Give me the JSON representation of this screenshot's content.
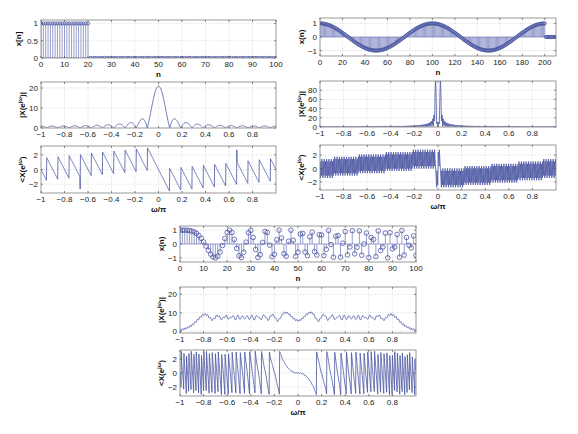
{
  "figure": {
    "width": 578,
    "height": 434,
    "line_color": "#4a55a2",
    "stem_color": "#6b74b8",
    "marker_color": "#4a55a2",
    "grid_color": "#c8c8c8",
    "axes_color": "#808080"
  },
  "chart_data": [
    {
      "id": "left-signal",
      "type": "stem",
      "box": [
        41,
        20,
        276,
        58
      ],
      "title": "",
      "xlabel": "n",
      "ylabel": "x[n]",
      "xlim": [
        0,
        100
      ],
      "ylim": [
        0,
        1.1
      ],
      "xticks": [
        0,
        10,
        20,
        30,
        40,
        50,
        60,
        70,
        80,
        90,
        100
      ],
      "yticks": [
        0,
        0.5,
        1
      ],
      "ytick_labels": [
        "0",
        "0.5",
        "1"
      ],
      "signal": {
        "kind": "rect",
        "n_start": 0,
        "n_end": 100,
        "ones_until": 20,
        "marker_size": 1.6
      },
      "description": "Rectangular pulse x[n]=1 for 0<=n<=20, 0 for 21<=n<=100"
    },
    {
      "id": "left-magnitude",
      "type": "line",
      "box": [
        41,
        82,
        276,
        128
      ],
      "xlabel": "",
      "ylabel": "|X(e^jω)|",
      "xlim": [
        -1,
        1
      ],
      "ylim": [
        0,
        23
      ],
      "xticks": [
        -1,
        -0.8,
        -0.6,
        -0.4,
        -0.2,
        0,
        0.2,
        0.4,
        0.6,
        0.8
      ],
      "yticks": [
        0,
        10,
        20
      ],
      "ytick_labels": [
        "0",
        "10",
        "20"
      ],
      "source": "left-signal",
      "quantity": "magnitude",
      "peak": {
        "x": 0,
        "y": 21
      }
    },
    {
      "id": "left-phase",
      "type": "line",
      "box": [
        41,
        146,
        276,
        193
      ],
      "xlabel": "ω/π",
      "ylabel": "<X(e^jω)",
      "xlim": [
        -1,
        1
      ],
      "ylim": [
        -3.2,
        3.2
      ],
      "xticks": [
        -1,
        -0.8,
        -0.6,
        -0.4,
        -0.2,
        0,
        0.2,
        0.4,
        0.6,
        0.8
      ],
      "yticks": [
        -2,
        0,
        2
      ],
      "ytick_labels": [
        "-2",
        "0",
        "2"
      ],
      "source": "left-signal",
      "quantity": "phase"
    },
    {
      "id": "right-signal",
      "type": "stem",
      "box": [
        320,
        18,
        556,
        56
      ],
      "xlabel": "n",
      "ylabel": "x(n)",
      "xlim": [
        0,
        210
      ],
      "ylim": [
        -1.4,
        1.4
      ],
      "xticks": [
        0,
        20,
        40,
        60,
        80,
        100,
        120,
        140,
        160,
        180,
        200
      ],
      "yticks": [
        -1,
        0,
        1
      ],
      "ytick_labels": [
        "-1",
        "0",
        "1"
      ],
      "signal": {
        "kind": "cos",
        "n_start": 0,
        "n_end": 210,
        "period": 100,
        "active_until": 200,
        "marker_size": 1.6
      },
      "description": "x[n]=cos(2πn/100) for 0<=n<=200, 0 after"
    },
    {
      "id": "right-magnitude",
      "type": "line",
      "box": [
        320,
        81,
        556,
        127
      ],
      "xlabel": "",
      "ylabel": "|X(e^jω)|",
      "xlim": [
        -1,
        1
      ],
      "ylim": [
        0,
        100
      ],
      "xticks": [
        -1,
        -0.8,
        -0.6,
        -0.4,
        -0.2,
        0,
        0.2,
        0.4,
        0.6,
        0.8
      ],
      "yticks": [
        0,
        20,
        40,
        60,
        80
      ],
      "ytick_labels": [
        "0",
        "20",
        "40",
        "60",
        "80"
      ],
      "source": "right-signal",
      "quantity": "magnitude",
      "peaks": [
        {
          "x": -0.02,
          "y": 90
        },
        {
          "x": 0.02,
          "y": 90
        }
      ]
    },
    {
      "id": "right-phase",
      "type": "line",
      "box": [
        320,
        145,
        556,
        190
      ],
      "xlabel": "ω/π",
      "ylabel": "<X(e^jω)",
      "xlim": [
        -1,
        1
      ],
      "ylim": [
        -3.2,
        3.5
      ],
      "xticks": [
        -1,
        -0.8,
        -0.6,
        -0.4,
        -0.2,
        0,
        0.2,
        0.4,
        0.6,
        0.8
      ],
      "yticks": [
        -2,
        0,
        2
      ],
      "ytick_labels": [
        "-2",
        "0",
        "2"
      ],
      "source": "right-signal",
      "quantity": "phase"
    },
    {
      "id": "center-signal",
      "type": "stem",
      "box": [
        180,
        226,
        416,
        262
      ],
      "xlabel": "n",
      "ylabel": "x(n)",
      "xlim": [
        0,
        100
      ],
      "ylim": [
        -1.3,
        1.3
      ],
      "xticks": [
        0,
        10,
        20,
        30,
        40,
        50,
        60,
        70,
        80,
        90,
        100
      ],
      "yticks": [
        -1,
        0,
        1
      ],
      "ytick_labels": [
        "-1",
        "0",
        "1"
      ],
      "signal": {
        "kind": "chirp",
        "n_start": 0,
        "n_end": 100,
        "rate": 0.000452,
        "marker_size": 2.3
      },
      "description": "Linear chirp x[n]=cos(π·0.0045·n²)"
    },
    {
      "id": "center-magnitude",
      "type": "line",
      "box": [
        180,
        287,
        416,
        333
      ],
      "xlabel": "",
      "ylabel": "|X(e^jω)|",
      "xlim": [
        -1,
        1
      ],
      "ylim": [
        -1,
        24
      ],
      "xticks": [
        -1,
        -0.8,
        -0.6,
        -0.4,
        -0.2,
        0,
        0.2,
        0.4,
        0.6,
        0.8
      ],
      "yticks": [
        0,
        10,
        20
      ],
      "ytick_labels": [
        "0",
        "10",
        "20"
      ],
      "source": "center-signal",
      "quantity": "magnitude",
      "band": {
        "from": -0.45,
        "to": 0.45,
        "level": 17
      }
    },
    {
      "id": "center-phase",
      "type": "line",
      "box": [
        180,
        350,
        416,
        396
      ],
      "xlabel": "ω/π",
      "ylabel": "<X(e^jω)",
      "xlim": [
        -1,
        1
      ],
      "ylim": [
        -3.3,
        3.3
      ],
      "xticks": [
        -1,
        -0.8,
        -0.6,
        -0.4,
        -0.2,
        0,
        0.2,
        0.4,
        0.6,
        0.8
      ],
      "yticks": [
        -2,
        0,
        2
      ],
      "ytick_labels": [
        "-2",
        "0",
        "2"
      ],
      "source": "center-signal",
      "quantity": "phase"
    }
  ]
}
